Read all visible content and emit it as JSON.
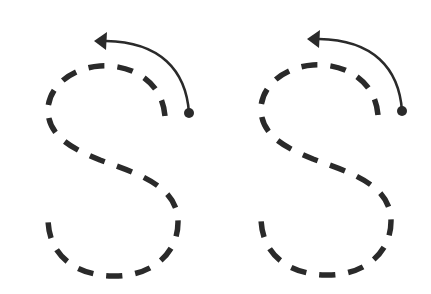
{
  "worksheet": {
    "letter": "S",
    "stroke_color": "#2a2a2a",
    "background": "#ffffff",
    "figures": [
      {
        "id": "left",
        "letter": "S",
        "offset_x": 0,
        "start_dot": [
          189,
          113
        ],
        "arrow_tip": [
          96,
          40
        ]
      },
      {
        "id": "right",
        "letter": "S",
        "offset_x": 215,
        "start_dot": [
          401,
          111
        ],
        "arrow_tip": [
          308,
          39
        ]
      }
    ]
  }
}
